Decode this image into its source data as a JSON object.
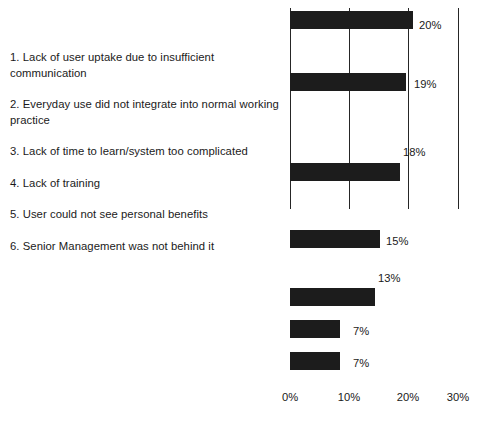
{
  "legend": {
    "items": [
      "1.  Lack of user uptake due to insufficient communication",
      "2.  Everyday use did not integrate into normal working practice",
      "3.  Lack of time to learn/system too complicated",
      "4.  Lack of training",
      "5.  User could not see personal benefits",
      "6. Senior Management was not behind it"
    ]
  },
  "chart_data": {
    "type": "bar",
    "orientation": "horizontal",
    "title": "",
    "xlabel": "",
    "ylabel": "",
    "xlim": [
      0,
      30
    ],
    "grid": true,
    "legend_position": "left",
    "categories": [
      "1.  Lack of user uptake due to insufficient communication",
      "2.  Everyday use did not integrate into normal working practice",
      "3.  Lack of time to learn/system too complicated",
      "4.  Lack of training",
      "5.  User could not see personal benefits",
      "6. Senior Management was not behind it"
    ],
    "values": [
      20,
      19,
      18,
      15,
      13,
      7
    ],
    "extra_value": 7,
    "bar_labels": [
      "20%",
      "19%",
      "18%",
      "15%",
      "13%",
      "7%",
      "7%"
    ],
    "bars": [
      {
        "label": "20%",
        "value": 20,
        "top": 11,
        "width": 123,
        "label_x": 419,
        "label_y": 19
      },
      {
        "label": "19%",
        "value": 19,
        "top": 73,
        "width": 116,
        "label_x": 414,
        "label_y": 78
      },
      {
        "label": "18%",
        "value": 18,
        "top": 163,
        "width": 110,
        "label_x": 403,
        "label_y": 146
      },
      {
        "label": "15%",
        "value": 15,
        "top": 230,
        "width": 90,
        "label_x": 386,
        "label_y": 235
      },
      {
        "label": "13%",
        "value": 13,
        "top": 288,
        "width": 85,
        "label_x": 378,
        "label_y": 272
      },
      {
        "label": "7%",
        "value": 7,
        "top": 320,
        "width": 50,
        "label_x": 353,
        "label_y": 325
      },
      {
        "label": "7%",
        "value": 7,
        "top": 352,
        "width": 50,
        "label_x": 353,
        "label_y": 357
      }
    ],
    "xticks": [
      {
        "label": "0%",
        "x": 290
      },
      {
        "label": "10%",
        "x": 349
      },
      {
        "label": "20%",
        "x": 408
      },
      {
        "label": "30%",
        "x": 458
      }
    ],
    "gridlines": [
      {
        "x": 290,
        "top": 8,
        "height": 201
      },
      {
        "x": 349,
        "top": 8,
        "height": 201
      },
      {
        "x": 408,
        "top": 8,
        "height": 201
      },
      {
        "x": 458,
        "top": 8,
        "height": 201
      }
    ],
    "axis_label_y": 391
  }
}
